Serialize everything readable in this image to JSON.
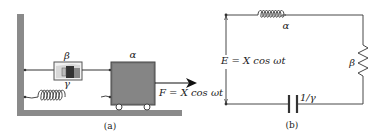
{
  "figure_a": {
    "caption": "(a)",
    "damper_label": "β",
    "spring_label": "γ",
    "mass_label": "α",
    "force_label": "F = X cos ωt"
  },
  "figure_b": {
    "caption": "(b)",
    "inductor_label": "α",
    "resistor_label": "β",
    "capacitor_label": "1/γ",
    "source_label": "E = X cos ωt"
  },
  "colors": {
    "wall": "#8a8a8a",
    "mass": "#7b7b7b",
    "line": "#333333"
  }
}
